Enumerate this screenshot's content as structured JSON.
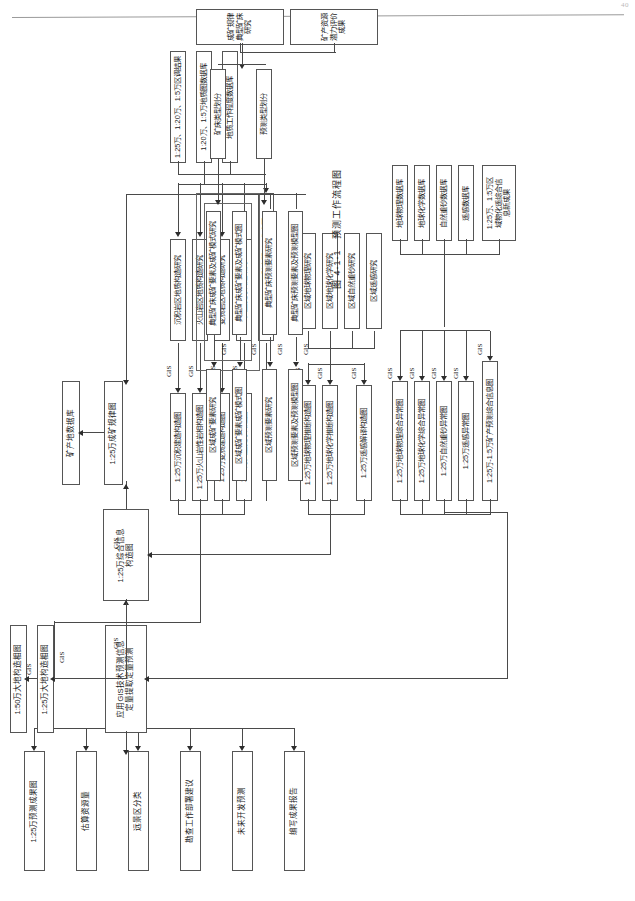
{
  "page": {
    "number": "40",
    "caption": "图 4-1-1　预测工作流程图"
  },
  "connector_label": "GIS",
  "outputs": [
    {
      "id": "out1",
      "label": "1:25万预测成果图"
    },
    {
      "id": "out2",
      "label": "估算资源量"
    },
    {
      "id": "out3",
      "label": "远景区分类"
    },
    {
      "id": "out4",
      "label": "勘查工作部署建议"
    },
    {
      "id": "out5",
      "label": "未来开发预测"
    },
    {
      "id": "out6",
      "label": "编写成果报告"
    }
  ],
  "core": {
    "gis_engine": "应用GIS技术预测信息\n定量提取定量预测",
    "tect_250k": "1:25万大地构造相图",
    "tect_500k": "1:50万大地构造相图",
    "synth_info": "1:25万综合信息\n构造图",
    "metallogenic": "1:25万成矿规律图",
    "mineral_db": "矿产地数据库"
  },
  "tectonics_maps": [
    {
      "label": "1:25万沉积建造构造图"
    },
    {
      "label": "1:25万火山岩性岩相构造图"
    },
    {
      "label": "1:25万变质建造构造图"
    },
    {
      "label": "1:25万大型变形构造图"
    }
  ],
  "tectonics_studies": [
    {
      "label": "沉积岩区地质构造研究"
    },
    {
      "label": "火山岩区地质构造研究"
    },
    {
      "label": "变质岩区地质构造研究"
    },
    {
      "label": "大型变形构造研究"
    }
  ],
  "base_map": "1:25万-1:5万矿产预测工作底图",
  "geophys_maps": [
    {
      "label": "1:25万地球物理推断构造图"
    },
    {
      "label": "1:25万地球化学推断构造图"
    },
    {
      "label": "1:25万遥感解译构造图"
    }
  ],
  "region_studies": [
    {
      "label": "区域地球物理研究"
    },
    {
      "label": "区域地球化学研究"
    },
    {
      "label": "区域自然重砂研究"
    },
    {
      "label": "区域遥感研究"
    }
  ],
  "anomaly_maps": [
    {
      "label": "1:25万地球物理综合异常图"
    },
    {
      "label": "1:25万地球化学综合异常图"
    },
    {
      "label": "1:25万自然重砂异常图"
    },
    {
      "label": "1:25万遥感异常图"
    },
    {
      "label": "1:25万-1:5万矿产预测综合信息图"
    }
  ],
  "databases": [
    {
      "label": "地球物理数据库"
    },
    {
      "label": "地球化学数据库"
    },
    {
      "label": "自然重砂数据库"
    },
    {
      "label": "遥感数据库"
    },
    {
      "label": "1:25万、1:5万区\n域物化遥综合信\n息新成果"
    }
  ],
  "geology_sources": [
    {
      "label": "1:25万、1:20万、1:5万区调结果"
    },
    {
      "label": "1:20万、1:5万地质图数据库"
    },
    {
      "label": "地质工作程度数据库"
    }
  ],
  "typical_deposit": [
    {
      "label": "典型矿床成矿要素及成矿模式研究"
    },
    {
      "label": "典型矿床成矿要素及成矿模式图"
    },
    {
      "label": "典型矿床预测要素研究"
    },
    {
      "label": "典型矿床预测要素及预测模型图"
    }
  ],
  "regional_deposit": [
    {
      "label": "区域成矿要素研究"
    },
    {
      "label": "区域成矿要素成矿模式图"
    },
    {
      "label": "区域预测要素研究"
    },
    {
      "label": "区域预测要素及预测模型图"
    }
  ],
  "classification": [
    {
      "label": "矿床类型划分"
    },
    {
      "label": "预测类型划分"
    }
  ],
  "deposit_inputs": [
    {
      "label": "成矿规律典型矿床研究"
    },
    {
      "label": "矿产资源潜力评价成果"
    }
  ]
}
